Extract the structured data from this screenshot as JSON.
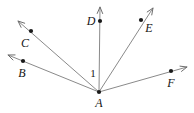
{
  "figure": {
    "kind": "geometry-diagram",
    "background_color": "#ffffff",
    "line_color": "#8a8a8a",
    "dot_color": "#1a1a1a",
    "label_color": "#141414",
    "width": 194,
    "height": 113
  },
  "vertex": {
    "name": "A",
    "label": "A",
    "x": 99,
    "y": 92,
    "label_x": 99,
    "label_y": 103
  },
  "rays": [
    {
      "id": "ray-ab",
      "endpoint_label": "B",
      "dot_x": 23,
      "dot_y": 61,
      "tip_x": 8,
      "tip_y": 55,
      "label_x": 22,
      "label_y": 73
    },
    {
      "id": "ray-ac",
      "endpoint_label": "C",
      "dot_x": 31,
      "dot_y": 31,
      "tip_x": 18,
      "tip_y": 21,
      "label_x": 25,
      "label_y": 43
    },
    {
      "id": "ray-ad",
      "endpoint_label": "D",
      "dot_x": 100,
      "dot_y": 21,
      "tip_x": 100,
      "tip_y": 7,
      "label_x": 91,
      "label_y": 21
    },
    {
      "id": "ray-ae",
      "endpoint_label": "E",
      "dot_x": 141,
      "dot_y": 20,
      "tip_x": 153,
      "tip_y": 8,
      "label_x": 149,
      "label_y": 28
    },
    {
      "id": "ray-af",
      "endpoint_label": "F",
      "dot_x": 171,
      "dot_y": 71,
      "tip_x": 187,
      "tip_y": 67,
      "label_x": 171,
      "label_y": 83
    }
  ],
  "angle_labels": [
    {
      "id": "angle-1",
      "text": "1",
      "x": 93,
      "y": 73
    }
  ]
}
